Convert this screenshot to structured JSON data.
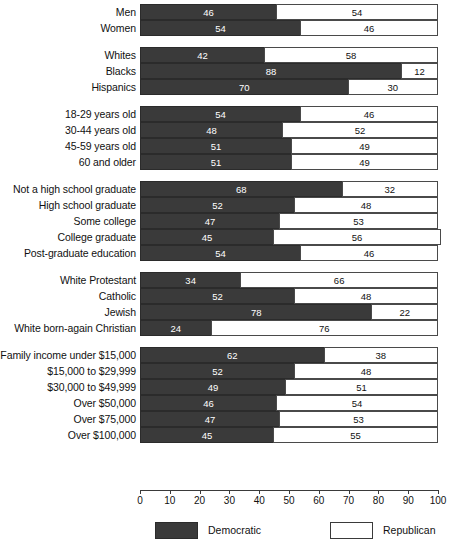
{
  "chart_data": {
    "type": "bar",
    "orientation": "horizontal",
    "stacked": true,
    "title": "",
    "xlabel": "",
    "ylabel": "",
    "xlim": [
      0,
      100
    ],
    "xticks": [
      0,
      10,
      20,
      30,
      40,
      50,
      60,
      70,
      80,
      90,
      100
    ],
    "xtick_labels": [
      "0",
      "10",
      "20",
      "30",
      "40",
      "50",
      "60",
      "70",
      "80",
      "90",
      "100"
    ],
    "grid": false,
    "legend_position": "bottom",
    "series": [
      {
        "name": "Democratic",
        "color": "#3a3a3a"
      },
      {
        "name": "Republican",
        "color": "#ffffff"
      }
    ],
    "groups": [
      {
        "name": "gender",
        "categories": [
          {
            "label": "Men",
            "democratic": 46,
            "republican": 54
          },
          {
            "label": "Women",
            "democratic": 54,
            "republican": 46
          }
        ]
      },
      {
        "name": "race",
        "categories": [
          {
            "label": "Whites",
            "democratic": 42,
            "republican": 58
          },
          {
            "label": "Blacks",
            "democratic": 88,
            "republican": 12
          },
          {
            "label": "Hispanics",
            "democratic": 70,
            "republican": 30
          }
        ]
      },
      {
        "name": "age",
        "categories": [
          {
            "label": "18-29 years old",
            "democratic": 54,
            "republican": 46
          },
          {
            "label": "30-44 years old",
            "democratic": 48,
            "republican": 52
          },
          {
            "label": "45-59 years old",
            "democratic": 51,
            "republican": 49
          },
          {
            "label": "60 and older",
            "democratic": 51,
            "republican": 49
          }
        ]
      },
      {
        "name": "education",
        "categories": [
          {
            "label": "Not a high school graduate",
            "democratic": 68,
            "republican": 32
          },
          {
            "label": "High school graduate",
            "democratic": 52,
            "republican": 48
          },
          {
            "label": "Some college",
            "democratic": 47,
            "republican": 53
          },
          {
            "label": "College graduate",
            "democratic": 45,
            "republican": 56
          },
          {
            "label": "Post-graduate education",
            "democratic": 54,
            "republican": 46
          }
        ]
      },
      {
        "name": "religion",
        "categories": [
          {
            "label": "White Protestant",
            "democratic": 34,
            "republican": 66
          },
          {
            "label": "Catholic",
            "democratic": 52,
            "republican": 48
          },
          {
            "label": "Jewish",
            "democratic": 78,
            "republican": 22
          },
          {
            "label": "White born-again Christian",
            "democratic": 24,
            "republican": 76
          }
        ]
      },
      {
        "name": "income",
        "categories": [
          {
            "label": "Family income under $15,000",
            "democratic": 62,
            "republican": 38
          },
          {
            "label": "$15,000 to $29,999",
            "democratic": 52,
            "republican": 48
          },
          {
            "label": "$30,000 to $49,999",
            "democratic": 49,
            "republican": 51
          },
          {
            "label": "Over $50,000",
            "democratic": 46,
            "republican": 54
          },
          {
            "label": "Over $75,000",
            "democratic": 47,
            "republican": 53
          },
          {
            "label": "Over $100,000",
            "democratic": 45,
            "republican": 55
          }
        ]
      }
    ]
  },
  "legend": {
    "democratic_label": "Democratic",
    "republican_label": "Republican"
  },
  "colors": {
    "democratic": "#3a3a3a",
    "republican": "#ffffff",
    "outline": "#3a3a3a",
    "background": "#ffffff"
  }
}
